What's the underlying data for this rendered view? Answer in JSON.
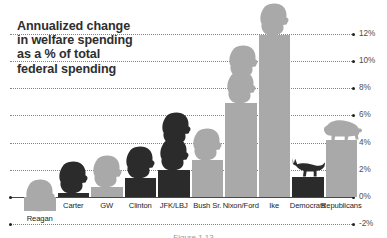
{
  "chart_data": {
    "type": "bar",
    "title": "Annualized change\nin welfare spending\nas a % of total\nfederal spending",
    "xlabel": "",
    "ylabel": "",
    "ylim": [
      -2,
      12
    ],
    "grid": true,
    "legend": "none",
    "categories": [
      "Reagan",
      "Carter",
      "GW",
      "Clinton",
      "JFK/LBJ",
      "Bush Sr.",
      "Nixon/Ford",
      "Ike",
      "Democrats",
      "Republicans"
    ],
    "values": [
      -1.0,
      0.3,
      0.7,
      1.4,
      2.0,
      2.7,
      6.9,
      11.9,
      1.5,
      4.2
    ],
    "tick_labels": [
      "12%",
      "10%",
      "8%",
      "6%",
      "4%",
      "2%",
      "0%",
      "-2%"
    ],
    "tick_values": [
      12,
      10,
      8,
      6,
      4,
      2,
      0,
      -2
    ],
    "bar_styles": [
      "light",
      "dark",
      "light",
      "dark",
      "dark",
      "light",
      "light",
      "light",
      "dark",
      "light"
    ],
    "figures": [
      "president-head-light",
      "president-head-dark",
      "president-head-light",
      "president-head-dark",
      "president-head-dark-double",
      "president-head-light",
      "president-head-light-double",
      "president-head-light",
      "donkey",
      "elephant"
    ],
    "colors": {
      "light_bar": "#a9a9a9",
      "dark_bar": "#2b2b2b",
      "title_text": "#2e2e2e",
      "axis_text": "#4e4e4e",
      "category_text": "#232323",
      "gridline": "#6e6e6e"
    }
  },
  "caption": {
    "text": "Figure 1.13"
  }
}
